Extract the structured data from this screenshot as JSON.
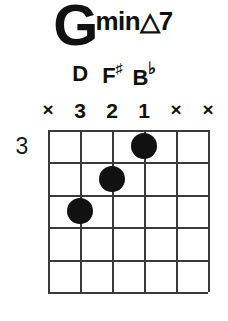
{
  "chord": {
    "root": "G",
    "quality_prefix": "min",
    "quality_symbol": "△",
    "quality_suffix": "7",
    "full_name": "G min△7",
    "position_label": "3",
    "ink_color": "#111111",
    "grid_color": "#3a3a3a",
    "background": "#ffffff"
  },
  "notes": [
    {
      "label": "",
      "accidental": "",
      "string": 1
    },
    {
      "label": "D",
      "accidental": "",
      "string": 2
    },
    {
      "label": "F",
      "accidental": "♯",
      "string": 3
    },
    {
      "label": "B",
      "accidental": "♭",
      "string": 4
    },
    {
      "label": "",
      "accidental": "",
      "string": 5
    },
    {
      "label": "",
      "accidental": "",
      "string": 6
    }
  ],
  "string_markers": [
    {
      "value": "×",
      "type": "mute",
      "string": 1
    },
    {
      "value": "3",
      "type": "finger",
      "string": 2
    },
    {
      "value": "2",
      "type": "finger",
      "string": 3
    },
    {
      "value": "1",
      "type": "finger",
      "string": 4
    },
    {
      "value": "×",
      "type": "mute",
      "string": 5
    },
    {
      "value": "×",
      "type": "mute",
      "string": 6
    }
  ],
  "fretboard": {
    "string_count": 6,
    "fret_count": 5,
    "base_fret": 3,
    "dots": [
      {
        "string": 4,
        "fret": 1,
        "finger": "1"
      },
      {
        "string": 3,
        "fret": 2,
        "finger": "2"
      },
      {
        "string": 2,
        "fret": 3,
        "finger": "3"
      }
    ]
  }
}
